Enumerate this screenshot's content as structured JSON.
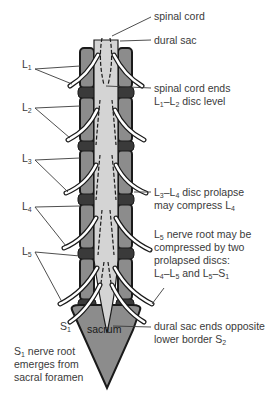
{
  "figure": {
    "colors": {
      "vertebra": "#8c8c8c",
      "vertebra_outline": "#1a1a1a",
      "dural_sac": "#d4d4d4",
      "disc": "#3a3a3a",
      "nerve": "#ffffff",
      "text": "#3a3a3a",
      "leader_line": "#3a3a3a"
    },
    "left_labels": [
      {
        "id": "L1",
        "letter": "L",
        "sub": "1"
      },
      {
        "id": "L2",
        "letter": "L",
        "sub": "2"
      },
      {
        "id": "L3",
        "letter": "L",
        "sub": "3"
      },
      {
        "id": "L4",
        "letter": "L",
        "sub": "4"
      },
      {
        "id": "L5",
        "letter": "L",
        "sub": "5"
      },
      {
        "id": "S1",
        "letter": "S",
        "sub": "1"
      }
    ],
    "sacrum_label": "sacrum",
    "s1_note": {
      "line1_letter": "S",
      "line1_sub": "1",
      "line1_rest": " nerve root",
      "line2": "emerges from",
      "line3": "sacral foramen"
    },
    "right_labels": {
      "spinal_cord": "spinal cord",
      "dural_sac": "dural sac",
      "cord_ends": {
        "line1": "spinal cord ends",
        "line2_a": "L",
        "line2_a_sub": "1",
        "line2_dash": "–",
        "line2_b": "L",
        "line2_b_sub": "2",
        "line2_rest": " disc level"
      },
      "l3l4": {
        "line1_a": "L",
        "line1_a_sub": "3",
        "line1_dash": "–",
        "line1_b": "L",
        "line1_b_sub": "4",
        "line1_rest": " disc prolapse",
        "line2": "may compress L",
        "line2_sub": "4"
      },
      "l5": {
        "line1_a": "L",
        "line1_a_sub": "5",
        "line1_rest": " nerve root may be",
        "line2": "compressed by two",
        "line3": "prolapsed discs:",
        "line4_a": "L",
        "line4_a_sub": "4",
        "line4_dash": "–",
        "line4_b": "L",
        "line4_b_sub": "5",
        "line4_mid": " and L",
        "line4_mid_sub": "5",
        "line4_dash2": "–S",
        "line4_end_sub": "1"
      },
      "dural_end": {
        "line1": "dural sac ends opposite",
        "line2": "lower border S",
        "line2_sub": "2"
      }
    }
  }
}
